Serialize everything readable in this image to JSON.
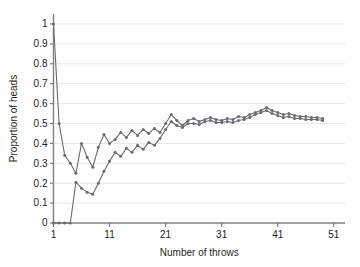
{
  "figure": {
    "top_cropped_text": "",
    "background_color": "#ffffff"
  },
  "chart_data": {
    "type": "line",
    "title": "",
    "subtitle": "",
    "xlabel": "Number of throws",
    "ylabel": "Proportion of heads",
    "xlim": [
      1,
      53
    ],
    "ylim": [
      0,
      1.05
    ],
    "xticks": [
      1,
      11,
      21,
      31,
      41,
      51
    ],
    "xtick_labels": [
      "1",
      "11",
      "21",
      "31",
      "41",
      "51"
    ],
    "yticks": [
      0,
      0.1,
      0.2,
      0.3,
      0.4,
      0.5,
      0.6,
      0.7,
      0.8,
      0.9,
      1
    ],
    "ytick_labels": [
      "0",
      "0.1",
      "0.2",
      "0.3",
      "0.4",
      "0.5",
      "0.6",
      "0.7",
      "0.8",
      "0.9",
      "1"
    ],
    "grid": "horizontal",
    "grid_color": "#e8e8ec",
    "axis_color": "#7f7f87",
    "legend": "none",
    "marker": "circle",
    "line_color": "#6b6b73",
    "x": [
      1,
      2,
      3,
      4,
      5,
      6,
      7,
      8,
      9,
      10,
      11,
      12,
      13,
      14,
      15,
      16,
      17,
      18,
      19,
      20,
      21,
      22,
      23,
      24,
      25,
      26,
      27,
      28,
      29,
      30,
      31,
      32,
      33,
      34,
      35,
      36,
      37,
      38,
      39,
      40,
      41,
      42,
      43,
      44,
      45,
      46,
      47,
      48,
      49
    ],
    "series": [
      {
        "name": "Series A",
        "values": [
          1.0,
          0.5,
          0.34,
          0.3,
          0.25,
          0.4,
          0.33,
          0.28,
          0.38,
          0.445,
          0.4,
          0.42,
          0.455,
          0.43,
          0.465,
          0.44,
          0.47,
          0.45,
          0.475,
          0.455,
          0.5,
          0.545,
          0.515,
          0.49,
          0.515,
          0.525,
          0.51,
          0.52,
          0.53,
          0.52,
          0.515,
          0.525,
          0.52,
          0.535,
          0.53,
          0.545,
          0.555,
          0.565,
          0.58,
          0.565,
          0.555,
          0.545,
          0.55,
          0.54,
          0.535,
          0.535,
          0.53,
          0.53,
          0.525
        ]
      },
      {
        "name": "Series B",
        "values": [
          0.0,
          0.0,
          0.0,
          0.0,
          0.205,
          0.175,
          0.155,
          0.145,
          0.2,
          0.26,
          0.31,
          0.355,
          0.335,
          0.375,
          0.355,
          0.39,
          0.37,
          0.405,
          0.39,
          0.425,
          0.47,
          0.51,
          0.49,
          0.48,
          0.5,
          0.5,
          0.495,
          0.51,
          0.515,
          0.505,
          0.505,
          0.51,
          0.505,
          0.515,
          0.52,
          0.53,
          0.545,
          0.555,
          0.565,
          0.55,
          0.54,
          0.53,
          0.535,
          0.525,
          0.525,
          0.52,
          0.52,
          0.52,
          0.515
        ]
      }
    ]
  }
}
